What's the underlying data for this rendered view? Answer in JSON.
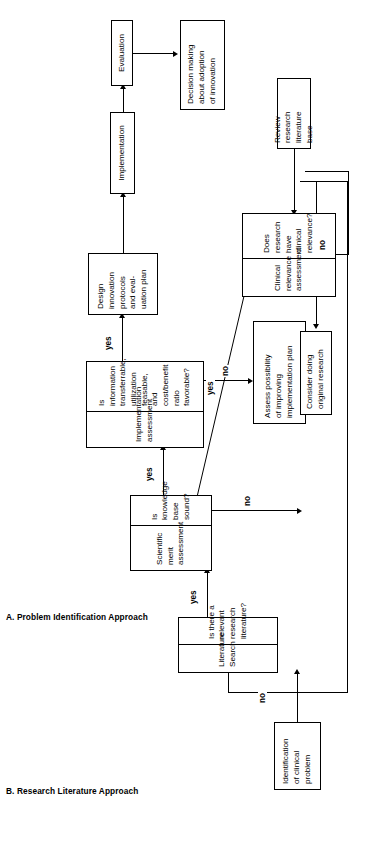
{
  "figure": {
    "orientation": "rotated-90-ccw",
    "type": "flowchart",
    "panels": [
      {
        "id": "A",
        "caption": "A. Problem Identification Approach"
      },
      {
        "id": "B",
        "caption": "B. Research Literature Approach"
      }
    ]
  },
  "nodes": {
    "identification": {
      "text": "Identification\nof clinical\nproblem"
    },
    "literature_search": {
      "header": "Literature\nSearch",
      "question": "Is there a\nrelevant\nresearch\nliterature?"
    },
    "scientific_merit": {
      "header": "Scientific\nmerit\nassessment",
      "question": "Is knowledge\nbase sound?"
    },
    "implementation_assessment": {
      "header": "Implementation\nassessment",
      "question": "Is information\ntransferrable,\nutilization\nfeasable, and\ncost/benefit ratio\nfavorable?"
    },
    "design_innovation": {
      "text": "Design\ninnovation\nprotocols\nand eval-\nuation plan"
    },
    "implementation": {
      "text": "Implementation"
    },
    "evaluation": {
      "text": "Evaluation"
    },
    "decision_making": {
      "text": "Decision making\nabout adoption\nof innovation"
    },
    "assess_possibility": {
      "text": "Assess possibility\nof improving\nimplementation plan"
    },
    "consider_research": {
      "text": "Consider doing\noriginal research"
    },
    "clinical_relevance": {
      "header": "Clinical\nrelevance\nassessment",
      "question": "Does\nresearch\nhave clinical\nrelevance?"
    },
    "review_literature": {
      "text": "Review\nresearch\nliterature\nbase"
    }
  },
  "edges": {
    "lit_search_no": "no",
    "lit_search_yes": "yes",
    "merit_yes": "yes",
    "merit_no": "no",
    "impl_yes": "yes",
    "impl_no": "no",
    "clinical_yes": "yes",
    "clinical_no": "no"
  },
  "colors": {
    "background": "#ffffff",
    "stroke": "#000000",
    "text": "#000000"
  }
}
